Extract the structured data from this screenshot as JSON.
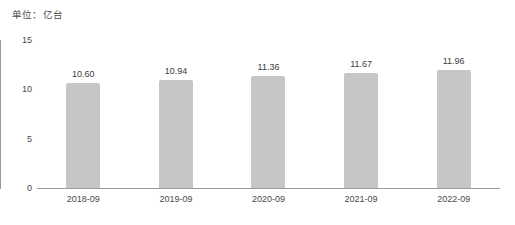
{
  "chart_data": {
    "type": "bar",
    "title": "",
    "subtitle": "单位：亿台",
    "xlabel": "",
    "ylabel": "",
    "categories": [
      "2018-09",
      "2019-09",
      "2020-09",
      "2021-09",
      "2022-09"
    ],
    "values": [
      10.6,
      10.94,
      11.36,
      11.67,
      11.96
    ],
    "value_labels": [
      "10.60",
      "10.94",
      "11.36",
      "11.67",
      "11.96"
    ],
    "ylim": [
      0,
      15
    ],
    "yticks": [
      0,
      5,
      10,
      15
    ],
    "ytick_labels": [
      "0",
      "5",
      "10",
      "15"
    ],
    "grid": false,
    "legend": "none",
    "bar_color": "#c6c6c6",
    "axis_color": "#9a9a9a",
    "text_color": "#3c3c3c"
  }
}
